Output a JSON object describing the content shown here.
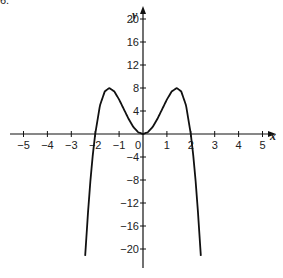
{
  "corner_label": "6.",
  "chart_data": {
    "type": "line",
    "title": "",
    "xlabel": "x",
    "ylabel": "y",
    "xlim": [
      -5.5,
      5.5
    ],
    "ylim": [
      -22,
      22
    ],
    "grid": false,
    "legend": null,
    "x_ticks": [
      -5,
      -4,
      -3,
      -2,
      -1,
      0,
      1,
      2,
      3,
      4,
      5
    ],
    "x_tick_labels": [
      "−5",
      "−4",
      "−3",
      "−2",
      "−1",
      "0",
      "1",
      "2",
      "3",
      "4",
      "5"
    ],
    "y_ticks": [
      -20,
      -16,
      -12,
      -8,
      -4,
      4,
      8,
      12,
      16,
      20
    ],
    "y_tick_labels": [
      "−20",
      "−16",
      "−12",
      "−8",
      "−4",
      "4",
      "8",
      "12",
      "16",
      "20"
    ],
    "series": [
      {
        "name": "curve",
        "x": [
          -2.42,
          -2.3,
          -2.2,
          -2.1,
          -2.0,
          -1.8,
          -1.6,
          -1.414,
          -1.2,
          -1.0,
          -0.8,
          -0.6,
          -0.4,
          -0.2,
          0,
          0.2,
          0.4,
          0.6,
          0.8,
          1.0,
          1.2,
          1.414,
          1.6,
          1.8,
          2.0,
          2.1,
          2.2,
          2.3,
          2.42
        ],
        "y": [
          -21.2,
          -13.6,
          -8.1,
          -3.6,
          0,
          5.0,
          7.4,
          8.0,
          7.4,
          6.0,
          4.3,
          2.6,
          1.2,
          0.3,
          0,
          0.3,
          1.2,
          2.6,
          4.3,
          6.0,
          7.4,
          8.0,
          7.4,
          5.0,
          0,
          -3.6,
          -8.1,
          -13.6,
          -21.2
        ]
      }
    ],
    "annotations": [
      "relative maxima at about (−1.4, 8) and (1.4, 8)",
      "local minimum at (0, 0)",
      "x-intercepts at −2, 0, 2"
    ]
  }
}
